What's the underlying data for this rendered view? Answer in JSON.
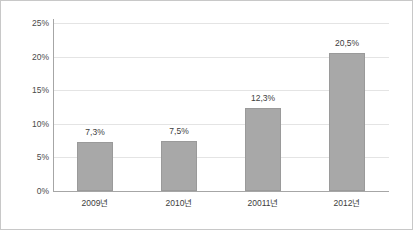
{
  "chart_data": {
    "type": "bar",
    "title": "",
    "xlabel": "",
    "ylabel": "",
    "categories": [
      "2009년",
      "2010년",
      "20011년",
      "2012년"
    ],
    "values": [
      7.3,
      7.5,
      12.3,
      20.5
    ],
    "value_labels": [
      "7,3%",
      "7,5%",
      "12,3%",
      "20,5%"
    ],
    "ylim": [
      0,
      25
    ],
    "ytick_values": [
      0,
      5,
      10,
      15,
      20,
      25
    ],
    "ytick_labels": [
      "0%",
      "5%",
      "10%",
      "15%",
      "20%",
      "25%"
    ],
    "grid": true,
    "legend": false,
    "series": [
      {
        "name": "",
        "values": [
          7.3,
          7.5,
          12.3,
          20.5
        ]
      }
    ],
    "colors": {
      "bar_fill": "#a8a8a8",
      "bar_stroke": "#9a9a9a",
      "gridline": "#e4e4e4",
      "axis": "#a6a6a6",
      "text": "#3d3d3d",
      "background": "#ffffff",
      "border": "#c8c8c8"
    }
  }
}
